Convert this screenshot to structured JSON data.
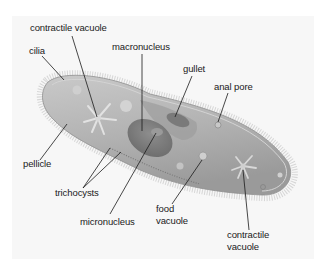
{
  "diagram": {
    "colors": {
      "background": "#ffffff",
      "panel": "#f7f7f7",
      "body_fill": "#b9b9b9",
      "body_dark": "#8a8a8a",
      "nucleus": "#7d7d7d",
      "leader_line": "#1a1a1a",
      "label_text": "#1a1a1a"
    },
    "labels": {
      "contractile_vacuole_top": "contractile vacuole",
      "cilia": "cilia",
      "macronucleus": "macronucleus",
      "gullet": "gullet",
      "anal_pore": "anal pore",
      "pellicle": "pellicle",
      "trichocysts": "trichocysts",
      "micronucleus": "micronucleus",
      "food_vacuole_line1": "food",
      "food_vacuole_line2": "vacuole",
      "contractile_vacuole_bottom_line1": "contractile",
      "contractile_vacuole_bottom_line2": "vacuole"
    }
  }
}
